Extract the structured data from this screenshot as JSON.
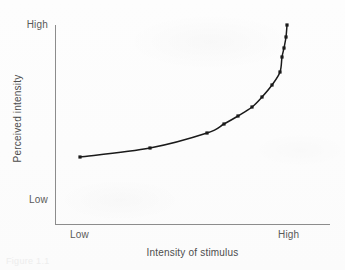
{
  "figure": {
    "background_color": "#fdfdfd",
    "axis_color": "#8c8c8c",
    "curve_color": "#1a1a1a",
    "text_color": "#4d4d4d",
    "caption_fragment": "Figure 1.1"
  },
  "chart_data": {
    "type": "line",
    "title": "",
    "subtitle": "",
    "xlabel": "Intensity of stimulus",
    "ylabel": "Perceived intensity",
    "grid": false,
    "legend": null,
    "x_tick_labels": [
      "Low",
      "High"
    ],
    "y_tick_labels": [
      "Low",
      "High"
    ],
    "xlim": [
      0,
      1
    ],
    "ylim": [
      0,
      1
    ],
    "annotations": [],
    "series": [
      {
        "name": "Perceived intensity vs. stimulus intensity",
        "marker": "square",
        "marker_color": "#1a1a1a",
        "line_color": "#1a1a1a",
        "x": [
          0.09,
          0.35,
          0.57,
          0.65,
          0.72,
          0.77,
          0.81,
          0.85,
          0.88,
          0.91,
          0.93,
          0.95,
          0.96
        ],
        "y": [
          0.34,
          0.39,
          0.46,
          0.5,
          0.54,
          0.58,
          0.63,
          0.69,
          0.75,
          0.8,
          0.86,
          0.92,
          1.0
        ],
        "px": [
          80,
          150,
          207,
          224,
          238,
          252,
          262,
          272,
          280,
          282,
          284,
          286,
          287
        ],
        "py": [
          157,
          148,
          133,
          124,
          116,
          107,
          97,
          85,
          72,
          57,
          48,
          37,
          25
        ]
      }
    ]
  }
}
